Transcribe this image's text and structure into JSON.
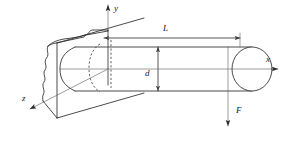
{
  "figure": {
    "type": "engineering-diagram",
    "background_color": "#ffffff",
    "line_color": "#2b2b2b",
    "thin_line_color": "#5a5a5a",
    "width_px": 288,
    "height_px": 141
  },
  "axes": {
    "x": {
      "label": "x",
      "direction": "right",
      "arrow": true,
      "label_x": 266,
      "label_y": 62
    },
    "y": {
      "label": "y",
      "direction": "up",
      "arrow": true,
      "label_x": 114,
      "label_y": 11
    },
    "z": {
      "label": "z",
      "direction": "down-left",
      "arrow": true,
      "label_x": 22,
      "label_y": 99
    }
  },
  "dimensions": [
    {
      "name": "length",
      "label": "L",
      "orientation": "horizontal",
      "label_x": 163,
      "label_y": 30,
      "from_x": 103,
      "to_x": 240,
      "y": 38
    },
    {
      "name": "diameter",
      "label": "d",
      "orientation": "vertical",
      "label_x": 146,
      "label_y": 77,
      "x": 158,
      "from_y": 47,
      "to_y": 91
    }
  ],
  "loads": [
    {
      "name": "applied-force",
      "label": "F",
      "direction": "down",
      "label_x": 238,
      "label_y": 112,
      "x": 228,
      "from_y": 66,
      "to_y": 126
    }
  ],
  "parts": [
    {
      "name": "wall-block",
      "description": "fixed support wall with broken edges"
    },
    {
      "name": "shaft-cylinder",
      "description": "circular cantilever shaft"
    },
    {
      "name": "shaft-end-cap",
      "description": "elliptical free end of shaft"
    },
    {
      "name": "hidden-root-circle",
      "description": "dashed outline of shaft at wall"
    }
  ]
}
